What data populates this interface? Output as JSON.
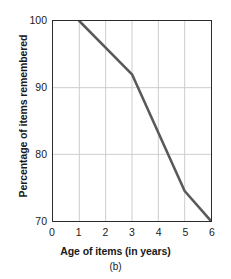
{
  "chart_data": {
    "type": "line",
    "title": "",
    "subtitle": "(b)",
    "xlabel": "Age of items (in years)",
    "ylabel": "Percentage of items remembered",
    "xlim": [
      0,
      6
    ],
    "ylim": [
      70,
      100
    ],
    "xticks": [
      "0",
      "1",
      "2",
      "3",
      "4",
      "5",
      "6"
    ],
    "yticks": [
      "70",
      "80",
      "90",
      "100"
    ],
    "xtick_values": [
      0,
      1,
      2,
      3,
      4,
      5,
      6
    ],
    "ytick_values": [
      70,
      80,
      90,
      100
    ],
    "grid": true,
    "grid_color": "#cccccc",
    "legend": null,
    "series": [
      {
        "name": "Percentage of items remembered",
        "color": "#595959",
        "line_width": 2.6,
        "x": [
          1,
          3,
          5,
          6
        ],
        "y": [
          100,
          92,
          74.5,
          70
        ],
        "points": [
          {
            "x": 1,
            "y": 100
          },
          {
            "x": 3,
            "y": 92
          },
          {
            "x": 5,
            "y": 74.5
          },
          {
            "x": 6,
            "y": 70
          }
        ]
      }
    ]
  },
  "axes": {
    "frame_color": "#2b2b2b",
    "tick_color": "#2b2b2b"
  }
}
